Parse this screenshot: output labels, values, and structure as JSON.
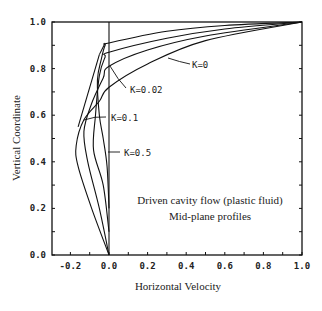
{
  "chart_data": {
    "type": "line",
    "title": "",
    "annotation": [
      "Driven cavity flow (plastic fluid)",
      "Mid-plane profiles"
    ],
    "xlabel": "Horizontal Velocity",
    "ylabel": "Vertical Coordinate",
    "xlim": [
      -0.29,
      1.0
    ],
    "ylim": [
      0.0,
      1.0
    ],
    "xticks": [
      "-0.2",
      "0.0",
      "0.2",
      "0.4",
      "0.6",
      "0.8",
      "1.0"
    ],
    "yticks": [
      "0.0",
      "0.2",
      "0.4",
      "0.6",
      "0.8",
      "1.0"
    ],
    "grid": false,
    "legend": "inline labels",
    "series": [
      {
        "name": "K=0",
        "label": "K=0",
        "points": [
          [
            0,
            0
          ],
          [
            -0.09,
            0.2
          ],
          [
            -0.16,
            0.38
          ],
          [
            -0.17,
            0.47
          ],
          [
            -0.13,
            0.58
          ],
          [
            -0.05,
            0.66
          ],
          [
            0,
            0.72
          ],
          [
            0.2,
            0.82
          ],
          [
            0.5,
            0.92
          ],
          [
            1.0,
            1.0
          ]
        ]
      },
      {
        "name": "K=0.02",
        "label": "K=0.02",
        "points": [
          [
            0,
            0
          ],
          [
            -0.05,
            0.2
          ],
          [
            -0.11,
            0.4
          ],
          [
            -0.13,
            0.53
          ],
          [
            -0.09,
            0.65
          ],
          [
            -0.03,
            0.76
          ],
          [
            0,
            0.81
          ],
          [
            0.2,
            0.88
          ],
          [
            0.5,
            0.94
          ],
          [
            1.0,
            1.0
          ]
        ]
      },
      {
        "name": "K=0.1",
        "label": "K=0.1",
        "points": [
          [
            0,
            0.1
          ],
          [
            -0.03,
            0.3
          ],
          [
            -0.08,
            0.45
          ],
          [
            -0.07,
            0.6
          ],
          [
            -0.05,
            0.77
          ],
          [
            -0.02,
            0.85
          ],
          [
            0,
            0.87
          ],
          [
            0.3,
            0.93
          ],
          [
            0.6,
            0.97
          ],
          [
            1.0,
            1.0
          ]
        ]
      },
      {
        "name": "K=0.5",
        "label": "K=0.5",
        "points": [
          [
            0,
            0.2
          ],
          [
            -0.01,
            0.38
          ],
          [
            -0.03,
            0.5
          ],
          [
            -0.05,
            0.6
          ],
          [
            -0.06,
            0.75
          ],
          [
            -0.04,
            0.84
          ],
          [
            -0.02,
            0.9
          ],
          [
            0,
            0.91
          ],
          [
            0.3,
            0.96
          ],
          [
            0.6,
            0.985
          ],
          [
            1.0,
            1.0
          ]
        ]
      }
    ]
  },
  "labels": {
    "K0": "K=0",
    "K002": "K=0.02",
    "K01": "K=0.1",
    "K05": "K=0.5",
    "annotation_line1": "Driven cavity flow (plastic fluid)",
    "annotation_line2": "Mid-plane profiles",
    "xlabel": "Horizontal Velocity",
    "ylabel": "Vertical Coordinate"
  }
}
